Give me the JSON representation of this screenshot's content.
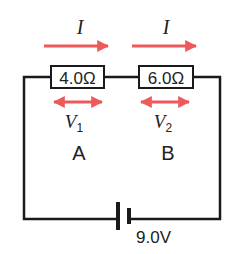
{
  "diagram": {
    "type": "series-circuit",
    "current_label": "I",
    "resistors": [
      {
        "id": "A",
        "label": "A",
        "value": "4.0Ω",
        "voltage_symbol": "V",
        "voltage_subscript": "1"
      },
      {
        "id": "B",
        "label": "B",
        "value": "6.0Ω",
        "voltage_symbol": "V",
        "voltage_subscript": "2"
      }
    ],
    "battery": {
      "voltage": "9.0V"
    },
    "colors": {
      "wire": "#1a1a1a",
      "arrow": "#ee5a5a"
    }
  }
}
